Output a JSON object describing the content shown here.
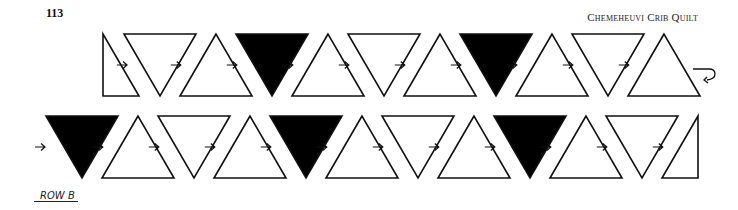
{
  "header": {
    "page_number": "113",
    "running_title": "Chemeheuvi Crib Quilt"
  },
  "diagram": {
    "colors": {
      "stroke": "#111111",
      "dark_fill": "#000000",
      "light_fill": "#ffffff"
    },
    "rows": [
      {
        "name": "row-a",
        "pieces": [
          "half-left",
          "down",
          "up",
          "down",
          "up",
          "down",
          "up",
          "down",
          "up",
          "down",
          "up"
        ],
        "fills": [
          "light",
          "light",
          "light",
          "dark",
          "light",
          "light",
          "light",
          "dark",
          "light",
          "light",
          "light"
        ],
        "lead_arrow": false,
        "end_marker": "return-arrow"
      },
      {
        "name": "row-b",
        "pieces": [
          "down",
          "up",
          "down",
          "up",
          "down",
          "up",
          "down",
          "up",
          "down",
          "up",
          "down",
          "half-right"
        ],
        "fills": [
          "dark",
          "light",
          "light",
          "light",
          "dark",
          "light",
          "light",
          "light",
          "dark",
          "light",
          "light",
          "light"
        ],
        "lead_arrow": true,
        "end_marker": "none"
      }
    ]
  },
  "footer": {
    "row_label": "ROW B"
  }
}
